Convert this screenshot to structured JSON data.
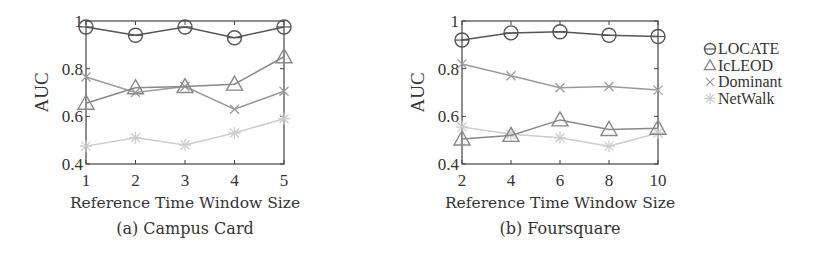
{
  "chart_data": [
    {
      "type": "line",
      "title": "(a) Campus Card",
      "xlabel": "Reference Time Window Size",
      "ylabel": "AUC",
      "x": [
        1,
        2,
        3,
        4,
        5
      ],
      "xticks": [
        "1",
        "2",
        "3",
        "4",
        "5"
      ],
      "yticks": [
        "0.4",
        "0.6",
        "0.8",
        "1"
      ],
      "ylim": [
        0.4,
        1.0
      ],
      "xlim": [
        1,
        5
      ],
      "grid": false,
      "series": [
        {
          "name": "LOCATE",
          "marker": "circle",
          "color": "#555555",
          "values": [
            0.975,
            0.94,
            0.975,
            0.93,
            0.975
          ]
        },
        {
          "name": "IcLEOD",
          "marker": "triangle",
          "color": "#888888",
          "values": [
            0.655,
            0.72,
            0.725,
            0.735,
            0.85
          ]
        },
        {
          "name": "Dominant",
          "marker": "x",
          "color": "#9a9a9a",
          "values": [
            0.765,
            0.7,
            0.725,
            0.63,
            0.705
          ]
        },
        {
          "name": "NetWalk",
          "marker": "star",
          "color": "#cccccc",
          "values": [
            0.475,
            0.51,
            0.48,
            0.53,
            0.59
          ]
        }
      ]
    },
    {
      "type": "line",
      "title": "(b) Foursquare",
      "xlabel": "Reference Time Window Size",
      "ylabel": "AUC",
      "x": [
        2,
        4,
        6,
        8,
        10
      ],
      "xticks": [
        "2",
        "4",
        "6",
        "8",
        "10"
      ],
      "yticks": [
        "0.4",
        "0.6",
        "0.8",
        "1"
      ],
      "ylim": [
        0.4,
        1.0
      ],
      "xlim": [
        2,
        10
      ],
      "grid": false,
      "series": [
        {
          "name": "LOCATE",
          "marker": "circle",
          "color": "#555555",
          "values": [
            0.92,
            0.95,
            0.955,
            0.94,
            0.935
          ]
        },
        {
          "name": "IcLEOD",
          "marker": "triangle",
          "color": "#888888",
          "values": [
            0.505,
            0.52,
            0.585,
            0.545,
            0.55
          ]
        },
        {
          "name": "Dominant",
          "marker": "x",
          "color": "#9a9a9a",
          "values": [
            0.82,
            0.77,
            0.72,
            0.725,
            0.71
          ]
        },
        {
          "name": "NetWalk",
          "marker": "star",
          "color": "#cccccc",
          "values": [
            0.555,
            0.525,
            0.51,
            0.475,
            0.53
          ]
        }
      ]
    }
  ],
  "legend": {
    "position": "right",
    "items": [
      {
        "label": "LOCATE",
        "icon": "circle-marker-icon"
      },
      {
        "label": "IcLEOD",
        "icon": "triangle-marker-icon"
      },
      {
        "label": "Dominant",
        "icon": "x-marker-icon"
      },
      {
        "label": "NetWalk",
        "icon": "star-marker-icon"
      }
    ]
  }
}
